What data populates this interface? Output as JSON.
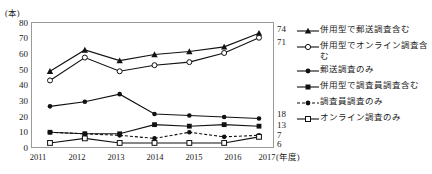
{
  "axis": {
    "y_unit": "(本)",
    "x_unit": "(年度)",
    "y_ticks": [
      "80",
      "70",
      "60",
      "50",
      "40",
      "30",
      "20",
      "10",
      "0"
    ],
    "x_ticks": [
      "2011",
      "2012",
      "2013",
      "2014",
      "2015",
      "2016",
      "2017"
    ]
  },
  "end_labels": {
    "v74": "74",
    "v71": "71",
    "v18": "18",
    "v13": "13",
    "v7": "7",
    "v6": "6"
  },
  "legend": {
    "items": [
      {
        "label": "併用型で郵送調査含む",
        "marker": "filled-triangle",
        "dash": "solid"
      },
      {
        "label": "併用型でオンライン調査含む",
        "marker": "open-circle",
        "dash": "solid"
      },
      {
        "label": "郵送調査のみ",
        "marker": "filled-circle",
        "dash": "solid"
      },
      {
        "label": "併用型で調査員調査含む",
        "marker": "filled-square",
        "dash": "solid"
      },
      {
        "label": "調査員調査のみ",
        "marker": "filled-circle",
        "dash": "dashed"
      },
      {
        "label": "オンライン調査のみ",
        "marker": "open-square",
        "dash": "solid"
      }
    ]
  },
  "chart_data": {
    "type": "line",
    "title": "",
    "xlabel": "(年度)",
    "ylabel": "(本)",
    "ylim": [
      0,
      80
    ],
    "ytick_step": 10,
    "grid": false,
    "legend_position": "right",
    "categories": [
      "2011",
      "2012",
      "2013",
      "2014",
      "2015",
      "2016",
      "2017"
    ],
    "series": [
      {
        "name": "併用型で郵送調査含む",
        "marker": "filled-triangle",
        "dash": "solid",
        "values": [
          49,
          63,
          56,
          60,
          62,
          65,
          74
        ],
        "end_label": "74"
      },
      {
        "name": "併用型でオンライン調査含む",
        "marker": "open-circle",
        "dash": "solid",
        "values": [
          43,
          58,
          49,
          53,
          55,
          61,
          71
        ],
        "end_label": "71"
      },
      {
        "name": "郵送調査のみ",
        "marker": "filled-circle",
        "dash": "solid",
        "values": [
          26,
          29,
          34,
          21,
          20,
          19,
          18
        ],
        "end_label": "18"
      },
      {
        "name": "併用型で調査員調査含む",
        "marker": "filled-square",
        "dash": "solid",
        "values": [
          9,
          8,
          8,
          14,
          13,
          14,
          13
        ],
        "end_label": "13"
      },
      {
        "name": "調査員調査のみ",
        "marker": "filled-circle",
        "dash": "dashed",
        "values": [
          9,
          8,
          7,
          5,
          9,
          6,
          7
        ],
        "end_label": "7"
      },
      {
        "name": "オンライン調査のみ",
        "marker": "open-square",
        "dash": "solid",
        "values": [
          2,
          5,
          2,
          2,
          2,
          2,
          6
        ],
        "end_label": "6"
      }
    ]
  }
}
